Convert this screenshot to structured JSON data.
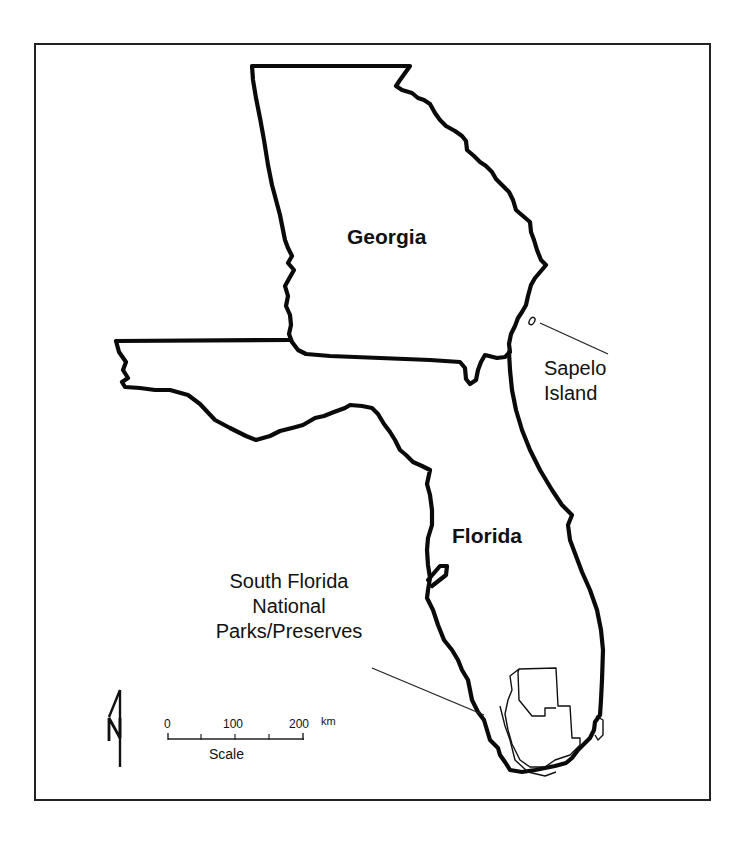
{
  "map": {
    "state_labels": [
      {
        "name": "Georgia"
      },
      {
        "name": "Florida"
      }
    ],
    "annotations": {
      "sapelo": {
        "line1": "Sapelo",
        "line2": "Island"
      },
      "south_florida": {
        "line1": "South Florida",
        "line2": "National",
        "line3": "Parks/Preserves"
      }
    },
    "north_arrow": {
      "letter": "N"
    },
    "scale_bar": {
      "ticks": [
        "0",
        "100",
        "200"
      ],
      "unit": "km",
      "caption": "Scale"
    },
    "colors": {
      "outline": "#0a0a0a",
      "background": "#ffffff"
    }
  }
}
